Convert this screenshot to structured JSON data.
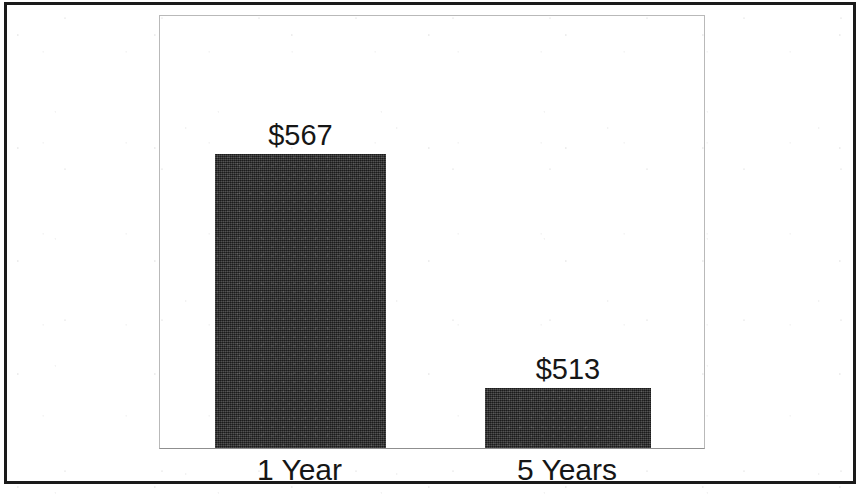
{
  "chart_data": {
    "type": "bar",
    "title": "",
    "subtitle": "",
    "xlabel": "",
    "ylabel": "",
    "categories": [
      "1 Year",
      "5 Years"
    ],
    "values": [
      567,
      513
    ],
    "value_labels": [
      "$567",
      "$513"
    ],
    "value_prefix": "$",
    "series": [
      {
        "name": "",
        "values": [
          567,
          513
        ]
      }
    ],
    "points": [
      {
        "category": "1 Year",
        "value": 567,
        "label": "$567"
      },
      {
        "category": "5 Years",
        "value": 513,
        "label": "$513"
      }
    ],
    "ylim": [
      556,
      569
    ],
    "axis_note": "Bar heights are not proportional to values; the value axis is truncated and no numeric ticks are drawn.",
    "grid": false,
    "legend": false,
    "legend_position": "none",
    "y_ticks": [],
    "x_ticks": [
      "1 Year",
      "5 Years"
    ],
    "bar_color": "#2b2b2b",
    "plot_background": "#ffffff",
    "plot_border_color": "#b9b9b9",
    "frame_color": "#1a1a1a",
    "text_color": "#161616"
  },
  "figure": {
    "frame": {
      "name": "outer-border"
    },
    "plot": {
      "name": "plot-area"
    }
  }
}
